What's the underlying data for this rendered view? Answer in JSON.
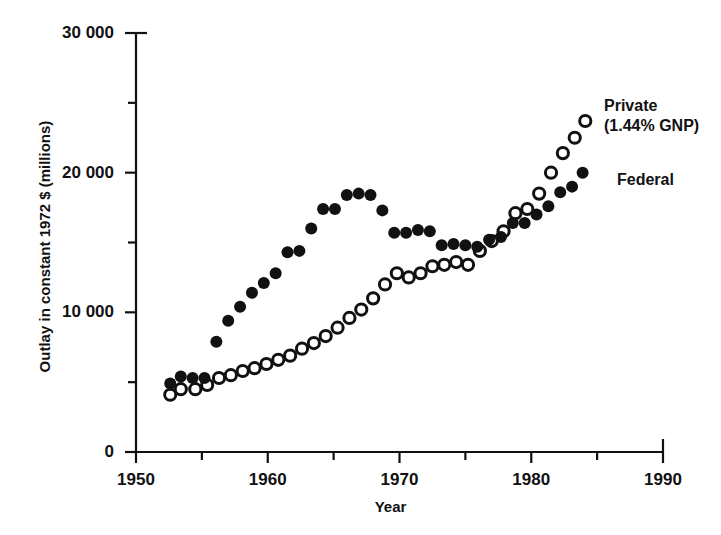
{
  "figure": {
    "background": "#ffffff",
    "ink_color": "#111111"
  },
  "axes": {
    "x": {
      "label": "Year",
      "ticks": [
        1950,
        1960,
        1970,
        1980,
        1990
      ],
      "tick_labels": [
        "1950",
        "1960",
        "1970",
        "1980",
        "1990"
      ],
      "minor_ticks": [
        1955,
        1965,
        1975,
        1985
      ],
      "range": [
        1950,
        1990
      ]
    },
    "y": {
      "label": "Outlay in constant 1972 $ (millions)",
      "ticks": [
        0,
        10000,
        20000,
        30000
      ],
      "tick_labels": [
        "0",
        "10 000",
        "20 000",
        "30 000"
      ],
      "minor_ticks": [
        5000,
        15000,
        25000
      ],
      "range": [
        0,
        30000
      ]
    }
  },
  "annotations": {
    "private_line1": "Private",
    "private_line2": "(1.44% GNP)",
    "federal": "Federal"
  },
  "chart_data": {
    "type": "scatter",
    "title": "",
    "xlabel": "Year",
    "ylabel": "Outlay in constant 1972 $ (millions)",
    "xlim": [
      1950,
      1990
    ],
    "ylim": [
      0,
      30000
    ],
    "grid": false,
    "legend_position": "inline-annotation-right",
    "series": [
      {
        "name": "Federal",
        "marker": "filled-circle",
        "color": "#111111",
        "points": [
          {
            "x": 1952.6,
            "y": 4900
          },
          {
            "x": 1953.4,
            "y": 5400
          },
          {
            "x": 1954.3,
            "y": 5300
          },
          {
            "x": 1955.2,
            "y": 5300
          },
          {
            "x": 1956.1,
            "y": 7900
          },
          {
            "x": 1957.0,
            "y": 9400
          },
          {
            "x": 1957.9,
            "y": 10400
          },
          {
            "x": 1958.8,
            "y": 11400
          },
          {
            "x": 1959.7,
            "y": 12100
          },
          {
            "x": 1960.6,
            "y": 12800
          },
          {
            "x": 1961.5,
            "y": 14300
          },
          {
            "x": 1962.4,
            "y": 14400
          },
          {
            "x": 1963.3,
            "y": 16000
          },
          {
            "x": 1964.2,
            "y": 17400
          },
          {
            "x": 1965.1,
            "y": 17400
          },
          {
            "x": 1966.0,
            "y": 18400
          },
          {
            "x": 1966.9,
            "y": 18500
          },
          {
            "x": 1967.8,
            "y": 18400
          },
          {
            "x": 1968.7,
            "y": 17300
          },
          {
            "x": 1969.6,
            "y": 15700
          },
          {
            "x": 1970.5,
            "y": 15700
          },
          {
            "x": 1971.4,
            "y": 15900
          },
          {
            "x": 1972.3,
            "y": 15800
          },
          {
            "x": 1973.2,
            "y": 14800
          },
          {
            "x": 1974.1,
            "y": 14900
          },
          {
            "x": 1975.0,
            "y": 14800
          },
          {
            "x": 1975.9,
            "y": 14700
          },
          {
            "x": 1976.8,
            "y": 15200
          },
          {
            "x": 1977.7,
            "y": 15400
          },
          {
            "x": 1978.6,
            "y": 16400
          },
          {
            "x": 1979.5,
            "y": 16400
          },
          {
            "x": 1980.4,
            "y": 17000
          },
          {
            "x": 1981.3,
            "y": 17600
          },
          {
            "x": 1982.2,
            "y": 18600
          },
          {
            "x": 1983.1,
            "y": 19000
          },
          {
            "x": 1983.9,
            "y": 20000
          }
        ]
      },
      {
        "name": "Private (1.44% GNP)",
        "marker": "open-circle",
        "color": "#111111",
        "points": [
          {
            "x": 1952.6,
            "y": 4100
          },
          {
            "x": 1953.4,
            "y": 4500
          },
          {
            "x": 1954.5,
            "y": 4500
          },
          {
            "x": 1955.4,
            "y": 4800
          },
          {
            "x": 1956.3,
            "y": 5300
          },
          {
            "x": 1957.2,
            "y": 5500
          },
          {
            "x": 1958.1,
            "y": 5800
          },
          {
            "x": 1959.0,
            "y": 6000
          },
          {
            "x": 1959.9,
            "y": 6300
          },
          {
            "x": 1960.8,
            "y": 6600
          },
          {
            "x": 1961.7,
            "y": 6900
          },
          {
            "x": 1962.6,
            "y": 7400
          },
          {
            "x": 1963.5,
            "y": 7800
          },
          {
            "x": 1964.4,
            "y": 8300
          },
          {
            "x": 1965.3,
            "y": 8900
          },
          {
            "x": 1966.2,
            "y": 9600
          },
          {
            "x": 1967.1,
            "y": 10200
          },
          {
            "x": 1968.0,
            "y": 11000
          },
          {
            "x": 1968.9,
            "y": 12000
          },
          {
            "x": 1969.8,
            "y": 12800
          },
          {
            "x": 1970.7,
            "y": 12500
          },
          {
            "x": 1971.6,
            "y": 12800
          },
          {
            "x": 1972.5,
            "y": 13300
          },
          {
            "x": 1973.4,
            "y": 13400
          },
          {
            "x": 1974.3,
            "y": 13600
          },
          {
            "x": 1975.2,
            "y": 13400
          },
          {
            "x": 1976.1,
            "y": 14400
          },
          {
            "x": 1977.0,
            "y": 15100
          },
          {
            "x": 1977.9,
            "y": 15800
          },
          {
            "x": 1978.8,
            "y": 17100
          },
          {
            "x": 1979.7,
            "y": 17400
          },
          {
            "x": 1980.6,
            "y": 18500
          },
          {
            "x": 1981.5,
            "y": 20000
          },
          {
            "x": 1982.4,
            "y": 21400
          },
          {
            "x": 1983.3,
            "y": 22500
          },
          {
            "x": 1984.1,
            "y": 23700
          }
        ]
      }
    ]
  }
}
